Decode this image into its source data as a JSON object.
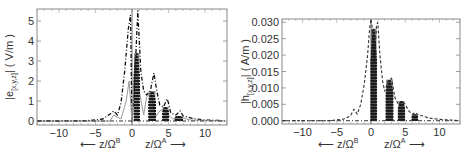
{
  "chart_data": [
    {
      "type": "line",
      "title": "",
      "xlabel_left": "← z/Ω^B",
      "xlabel_right": "z/Ω^A →",
      "ylabel": "|e(x,y,z)| ( V/m )",
      "xlim": [
        -13,
        13
      ],
      "ylim": [
        -0.2,
        5.6
      ],
      "x_ticks": [
        -10,
        -5,
        0,
        5,
        10
      ],
      "x_tick_labels": [
        "−10",
        "−5",
        "0",
        "5",
        "10"
      ],
      "y_ticks": [
        0,
        1,
        2,
        3,
        4,
        5
      ],
      "y_tick_labels": [
        "0",
        "1",
        "2",
        "3",
        "4",
        "5"
      ],
      "grid": false,
      "legend": null,
      "series": [
        {
          "name": "dot-dash envelope",
          "style": "dashdot",
          "x": [
            -13,
            -10,
            -6,
            -4,
            -3,
            -2.5,
            -2,
            -1.5,
            -1,
            -0.5,
            -0.2,
            0,
            0.3,
            0.8,
            1.0,
            1.2,
            1.6,
            2.0,
            2.5,
            3.0,
            3.4,
            3.8,
            4.3,
            4.8,
            5.0,
            5.3,
            6.0,
            6.6,
            7.0,
            7.5,
            8.5,
            10,
            12.5
          ],
          "y": [
            0.0,
            0.0,
            0.02,
            0.1,
            0.35,
            0.5,
            0.3,
            0.9,
            2.5,
            4.6,
            5.3,
            0.0,
            1.5,
            5.5,
            4.0,
            2.5,
            1.5,
            1.3,
            1.5,
            2.4,
            1.5,
            0.8,
            0.7,
            1.1,
            0.9,
            0.4,
            0.3,
            0.5,
            0.25,
            0.2,
            0.12,
            0.05,
            0.02
          ]
        },
        {
          "name": "solid gray",
          "style": "solid",
          "x": [
            -13,
            -3,
            -2.5,
            -1.5,
            -0.8,
            -0.4,
            0,
            0.4,
            1.0,
            1.6,
            2.0,
            2.6,
            3.2,
            3.8,
            4.4,
            5.0,
            5.6,
            6.4,
            8,
            12.5
          ],
          "y": [
            0.0,
            0.0,
            0.3,
            0.1,
            1.0,
            2.0,
            0.0,
            3.2,
            1.5,
            0.3,
            1.2,
            1.4,
            0.2,
            0.5,
            0.6,
            0.3,
            0.1,
            0.2,
            0.05,
            0.0
          ]
        },
        {
          "name": "dense filled oscillation",
          "style": "filled",
          "bands": [
            {
              "x": [
                0.3,
                1.0
              ],
              "ymax": 3.4
            },
            {
              "x": [
                2.3,
                3.2
              ],
              "ymax": 1.5
            },
            {
              "x": [
                4.2,
                5.0
              ],
              "ymax": 0.7
            },
            {
              "x": [
                5.9,
                6.9
              ],
              "ymax": 0.25
            }
          ]
        }
      ]
    },
    {
      "type": "line",
      "title": "",
      "xlabel_left": "← z/Ω^B",
      "xlabel_right": "z/Ω^A →",
      "ylabel": "|h(x,y,z)| ( A/m )",
      "xlim": [
        -13,
        13
      ],
      "ylim": [
        -0.001,
        0.031
      ],
      "x_ticks": [
        -10,
        -5,
        0,
        5,
        10
      ],
      "x_tick_labels": [
        "−10",
        "−5",
        "0",
        "5",
        "10"
      ],
      "y_ticks": [
        0.0,
        0.005,
        0.01,
        0.015,
        0.02,
        0.025,
        0.03
      ],
      "y_tick_labels": [
        "0.000",
        "0.005",
        "0.010",
        "0.015",
        "0.020",
        "0.025",
        "0.030"
      ],
      "grid": false,
      "legend": null,
      "series": [
        {
          "name": "dashed envelope",
          "style": "dashed",
          "x": [
            -13,
            -6,
            -4,
            -3,
            -2.5,
            -2,
            -1.5,
            -1,
            -0.5,
            -0.2,
            0,
            0.2,
            0.5,
            0.8,
            1.0,
            1.3,
            1.7,
            2.0,
            2.5,
            3.0,
            3.5,
            4.0,
            4.5,
            5.0,
            5.5,
            6.0,
            6.5,
            7.0,
            7.5,
            8.5,
            10,
            12.5
          ],
          "y": [
            0.0,
            0.0,
            0.0005,
            0.0015,
            0.0035,
            0.002,
            0.005,
            0.011,
            0.02,
            0.028,
            0.031,
            0.028,
            0.018,
            0.029,
            0.03,
            0.02,
            0.012,
            0.009,
            0.012,
            0.013,
            0.007,
            0.005,
            0.006,
            0.005,
            0.003,
            0.002,
            0.0025,
            0.0015,
            0.0015,
            0.0008,
            0.0004,
            0.0001
          ]
        },
        {
          "name": "dense filled oscillation",
          "style": "filled",
          "bands": [
            {
              "x": [
                0.0,
                0.8
              ],
              "ymax": 0.028
            },
            {
              "x": [
                2.2,
                3.2
              ],
              "ymax": 0.0125
            },
            {
              "x": [
                4.0,
                4.9
              ],
              "ymax": 0.006
            },
            {
              "x": [
                6.0,
                6.8
              ],
              "ymax": 0.002
            }
          ]
        }
      ]
    }
  ],
  "panels": {
    "left": {
      "ylabel_base": "|e",
      "ylabel_sub": "[x,y,z]",
      "ylabel_tail": "| ( V/m )",
      "xlabel_left": "⟵ z/Ω",
      "xlabel_left_sup": "B",
      "xlabel_right": "z/Ω",
      "xlabel_right_sup": "A",
      "xlabel_right_arrow": "⟶"
    },
    "right": {
      "ylabel_base": "|h",
      "ylabel_sub": "[x,y,z]",
      "ylabel_tail": "| ( A/m )",
      "xlabel_left": "⟵ z/Ω",
      "xlabel_left_sup": "B",
      "xlabel_right": "z/Ω",
      "xlabel_right_sup": "A",
      "xlabel_right_arrow": "⟶"
    }
  }
}
